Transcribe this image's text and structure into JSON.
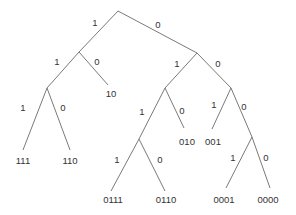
{
  "diagram": {
    "type": "binary-code-tree",
    "colors": {
      "edge": "#7a7a7a",
      "text": "#333333",
      "background": "#ffffff"
    },
    "nodes": [
      {
        "id": "root",
        "x": 118,
        "y": 11
      },
      {
        "id": "n1",
        "x": 79,
        "y": 52
      },
      {
        "id": "n0",
        "x": 197,
        "y": 53
      },
      {
        "id": "n11",
        "x": 47,
        "y": 88
      },
      {
        "id": "n10",
        "x": 108,
        "y": 85
      },
      {
        "id": "n111",
        "x": 23,
        "y": 150
      },
      {
        "id": "n110",
        "x": 70,
        "y": 150
      },
      {
        "id": "n01",
        "x": 165,
        "y": 88
      },
      {
        "id": "n00",
        "x": 231,
        "y": 88
      },
      {
        "id": "n011",
        "x": 139,
        "y": 139
      },
      {
        "id": "n010",
        "x": 184,
        "y": 128
      },
      {
        "id": "n0111",
        "x": 111,
        "y": 191
      },
      {
        "id": "n0110",
        "x": 165,
        "y": 191
      },
      {
        "id": "n001",
        "x": 212,
        "y": 129
      },
      {
        "id": "n000",
        "x": 252,
        "y": 137
      },
      {
        "id": "n0001",
        "x": 226,
        "y": 188
      },
      {
        "id": "n0000",
        "x": 270,
        "y": 188
      }
    ],
    "edges": [
      {
        "from": "root",
        "to": "n1",
        "label": "1",
        "lx": 95,
        "ly": 26
      },
      {
        "from": "root",
        "to": "n0",
        "label": "0",
        "lx": 158,
        "ly": 28
      },
      {
        "from": "n1",
        "to": "n11",
        "label": "1",
        "lx": 57,
        "ly": 65
      },
      {
        "from": "n1",
        "to": "n10",
        "label": "0",
        "lx": 97,
        "ly": 65
      },
      {
        "from": "n11",
        "to": "n111",
        "label": "1",
        "lx": 23,
        "ly": 111
      },
      {
        "from": "n11",
        "to": "n110",
        "label": "0",
        "lx": 63,
        "ly": 111
      },
      {
        "from": "n0",
        "to": "n01",
        "label": "1",
        "lx": 177,
        "ly": 67
      },
      {
        "from": "n0",
        "to": "n00",
        "label": "0",
        "lx": 218,
        "ly": 67
      },
      {
        "from": "n01",
        "to": "n011",
        "label": "1",
        "lx": 142,
        "ly": 115
      },
      {
        "from": "n01",
        "to": "n010",
        "label": "0",
        "lx": 182,
        "ly": 114
      },
      {
        "from": "n00",
        "to": "n001",
        "label": "1",
        "lx": 214,
        "ly": 108
      },
      {
        "from": "n00",
        "to": "n000",
        "label": "0",
        "lx": 244,
        "ly": 110
      },
      {
        "from": "n011",
        "to": "n0111",
        "label": "1",
        "lx": 117,
        "ly": 163
      },
      {
        "from": "n011",
        "to": "n0110",
        "label": "0",
        "lx": 160,
        "ly": 163
      },
      {
        "from": "n000",
        "to": "n0001",
        "label": "1",
        "lx": 233,
        "ly": 161
      },
      {
        "from": "n000",
        "to": "n0000",
        "label": "0",
        "lx": 266,
        "ly": 161
      }
    ],
    "leaves": [
      {
        "code": "111",
        "x": 23,
        "y": 164
      },
      {
        "code": "110",
        "x": 70,
        "y": 164
      },
      {
        "code": "10",
        "x": 111,
        "y": 97
      },
      {
        "code": "010",
        "x": 187,
        "y": 145
      },
      {
        "code": "001",
        "x": 213,
        "y": 145
      },
      {
        "code": "0111",
        "x": 113,
        "y": 203
      },
      {
        "code": "0110",
        "x": 166,
        "y": 203
      },
      {
        "code": "0001",
        "x": 224,
        "y": 203
      },
      {
        "code": "0000",
        "x": 268,
        "y": 203
      }
    ]
  }
}
